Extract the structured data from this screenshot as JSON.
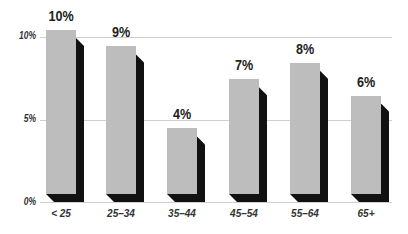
{
  "chart_data": {
    "type": "bar",
    "title": "",
    "xlabel": "",
    "ylabel": "",
    "categories": [
      "< 25",
      "25–34",
      "35–44",
      "45–54",
      "55–64",
      "65+"
    ],
    "values": [
      10,
      9,
      4,
      7,
      8,
      6
    ],
    "value_labels": [
      "10%",
      "9%",
      "4%",
      "7%",
      "8%",
      "6%"
    ],
    "yticks": [
      "0%",
      "5%",
      "10%"
    ],
    "ylim": [
      0,
      10
    ],
    "grid": true,
    "legend": null,
    "style": "3d-shadow"
  },
  "colors": {
    "bar_front": "#bdbdbd",
    "bar_shadow": "#111111",
    "gridline": "#cfcfcf",
    "text": "#222222"
  }
}
